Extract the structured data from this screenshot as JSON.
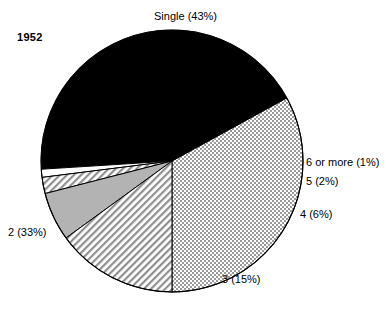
{
  "figure": {
    "year_label": "1952",
    "background": "#ffffff",
    "stroke": "#000000"
  },
  "chart_data": {
    "type": "pie",
    "title": "1952",
    "xlabel": "",
    "ylabel": "",
    "grid": false,
    "legend_position": "none",
    "labels_position": "outside-callout",
    "categories": [
      "Single",
      "2",
      "3",
      "4",
      "5",
      "6 or more"
    ],
    "values": [
      43,
      33,
      15,
      6,
      2,
      1
    ],
    "units": "percent",
    "annotations": [
      "1952"
    ],
    "slices": [
      {
        "key": "single",
        "label": "Single (43%)",
        "name": "Single",
        "value": 43,
        "fill": "black",
        "fill_hex": "#000000",
        "label_x": 154,
        "label_y": 10
      },
      {
        "key": "two",
        "label": "2 (33%)",
        "name": "2",
        "value": 33,
        "fill": "dotted",
        "fill_hex": "#e8e8e8",
        "label_x": 8,
        "label_y": 226
      },
      {
        "key": "three",
        "label": "3 (15%)",
        "name": "3",
        "value": 15,
        "fill": "diagonal-hatch",
        "fill_hex": "#f2f2f2",
        "label_x": 222,
        "label_y": 273
      },
      {
        "key": "four",
        "label": "4 (6%)",
        "name": "4",
        "value": 6,
        "fill": "solid-gray",
        "fill_hex": "#b3b3b3",
        "label_x": 300,
        "label_y": 208
      },
      {
        "key": "five",
        "label": "5 (2%)",
        "name": "5",
        "value": 2,
        "fill": "diagonal-hatch",
        "fill_hex": "#f2f2f2",
        "label_x": 306,
        "label_y": 175
      },
      {
        "key": "six",
        "label": "6 or more (1%)",
        "name": "6 or more",
        "value": 1,
        "fill": "white",
        "fill_hex": "#ffffff",
        "label_x": 306,
        "label_y": 156
      }
    ],
    "geometry": {
      "center_x": 172,
      "center_y": 161,
      "radius": 131,
      "start_angle_deg": 180,
      "direction": "counterclockwise"
    }
  }
}
